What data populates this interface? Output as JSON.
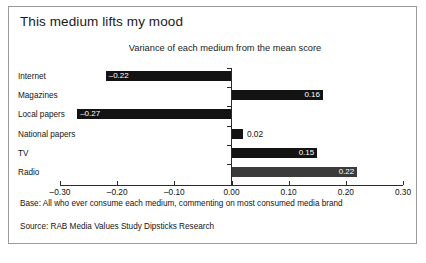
{
  "figure": {
    "title": "This medium lifts my mood",
    "subtitle": "Variance of each medium from the mean score",
    "footnote_base": "Base: All who ever consume each medium, commenting on most consumed media brand",
    "footnote_source": "Source: RAB Media Values Study Dipsticks Research",
    "frame_color": "#9a9a9a",
    "bar_color": "#131313",
    "bar_color_highlight": "#3b3b3b",
    "text_color": "#141414"
  },
  "chart_data": {
    "type": "bar",
    "orientation": "horizontal",
    "title": "This medium lifts my mood",
    "subtitle": "Variance of each medium from the mean score",
    "xlabel": "",
    "ylabel": "",
    "categories": [
      "Internet",
      "Magazines",
      "Local papers",
      "National papers",
      "TV",
      "Radio"
    ],
    "values": [
      -0.22,
      0.16,
      -0.27,
      0.02,
      0.15,
      0.22
    ],
    "value_labels": [
      "–0.22",
      "0.16",
      "–0.27",
      "0.02",
      "0.15",
      "0.22"
    ],
    "label_placement": [
      "inside",
      "inside",
      "inside",
      "outside",
      "inside",
      "inside"
    ],
    "bar_colors": [
      "#131313",
      "#131313",
      "#131313",
      "#131313",
      "#131313",
      "#3b3b3b"
    ],
    "xlim": [
      -0.3,
      0.3
    ],
    "xticks": [
      -0.3,
      -0.2,
      -0.1,
      0.0,
      0.1,
      0.2,
      0.3
    ],
    "xtick_labels": [
      "–0.30",
      "–0.20",
      "–0.10",
      "0.00",
      "0.10",
      "0.20",
      "0.30"
    ],
    "grid": false,
    "legend": null,
    "zero_reference_line": 0.0
  }
}
